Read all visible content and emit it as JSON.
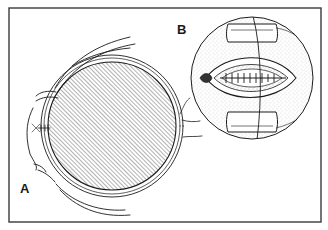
{
  "figure": {
    "type": "medical-illustration",
    "panels": [
      {
        "id": "A",
        "label": "A",
        "description": "Side view of eyeball with hatched globe, surrounding tissue layers and optic nerve"
      },
      {
        "id": "B",
        "label": "B",
        "description": "Circular magnified inset of sutured incision with retractors"
      }
    ]
  },
  "colors": {
    "ink": "#1a1a1a",
    "frame": "#3a3a3a",
    "background": "#ffffff",
    "stipple": "#6a6a6a"
  }
}
